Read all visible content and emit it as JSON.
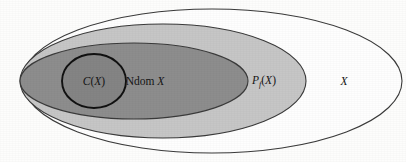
{
  "figure": {
    "type": "euler-diagram",
    "background_color": "#fdfdfc",
    "regions": [
      {
        "id": "outer",
        "name": "X",
        "label": "X",
        "label_italic": true,
        "fill": "#fefefe",
        "stroke": "#3a3a3a",
        "shape": "ellipse",
        "cx": 212,
        "cy": 81,
        "rx": 190,
        "ry": 72,
        "label_x": 344,
        "label_y": 85
      },
      {
        "id": "pf",
        "name": "P_f(X)",
        "label_main": "P",
        "label_sub": "f",
        "label_open": "(",
        "label_var": "X",
        "label_close": ")",
        "fill": "#c6c6c6",
        "stroke": "#3a3a3a",
        "shape": "ellipse",
        "cx": 163,
        "cy": 81,
        "rx": 143,
        "ry": 57,
        "label_x": 264,
        "label_y": 84
      },
      {
        "id": "ndom",
        "name": "Ndom X",
        "label_main": "Ndom",
        "label_var": "X",
        "fill": "#8d8d8d",
        "stroke": "#3a3a3a",
        "shape": "ellipse",
        "cx": 134,
        "cy": 81,
        "rx": 114,
        "ry": 38,
        "label_x": 145,
        "label_y": 85
      },
      {
        "id": "cx",
        "name": "C(X)",
        "label_main": "C",
        "label_open": "(",
        "label_var": "X",
        "label_close": ")",
        "fill": "#848484",
        "stroke": "#111111",
        "shape": "ellipse",
        "cx": 94,
        "cy": 81,
        "rx": 32,
        "ry": 27,
        "label_x": 94,
        "label_y": 85
      }
    ],
    "labels": {
      "outer_set": "X",
      "finite_powerset": "Pf (X)",
      "ndom": "Ndom X",
      "core": "C(X)"
    }
  }
}
